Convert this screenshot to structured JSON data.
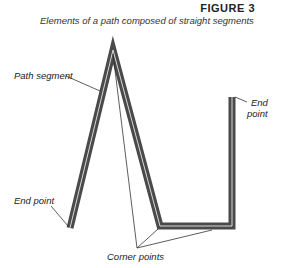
{
  "figure": {
    "number": "FIGURE 3",
    "caption": "Elements of a path composed of straight segments"
  },
  "labels": {
    "path_segment": "Path segment",
    "end_point_left": "End point",
    "end_point_right_line1": "End",
    "end_point_right_line2": "point",
    "corner_points": "Corner points"
  },
  "colors": {
    "stroke": "#4a4a4a",
    "highlight": "#d8d8d8",
    "leader": "#333333"
  }
}
